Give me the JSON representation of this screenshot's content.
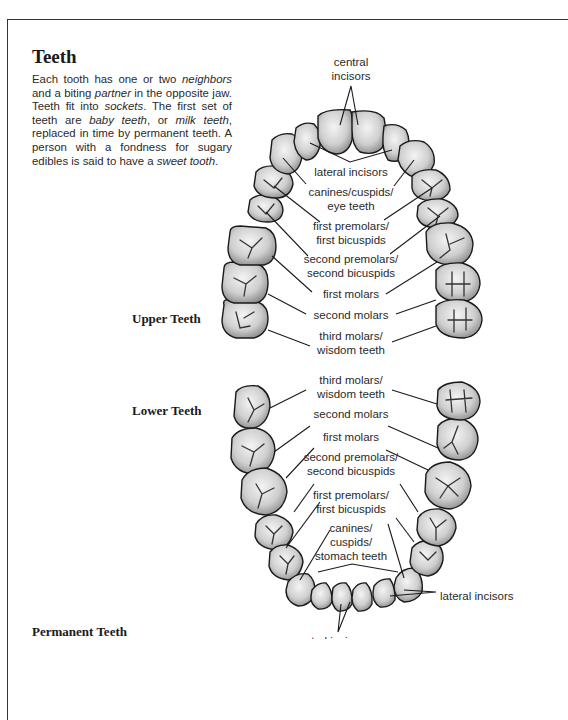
{
  "title": "Teeth",
  "intro": {
    "segments": [
      {
        "text": "Each tooth has one or two ",
        "italic": false
      },
      {
        "text": "neighbors",
        "italic": true
      },
      {
        "text": " and a biting ",
        "italic": false
      },
      {
        "text": "partner",
        "italic": true
      },
      {
        "text": " in the opposite jaw. Teeth fit into ",
        "italic": false
      },
      {
        "text": "sockets",
        "italic": true
      },
      {
        "text": ". The first set of teeth are ",
        "italic": false
      },
      {
        "text": "baby teeth",
        "italic": true
      },
      {
        "text": ", or ",
        "italic": false
      },
      {
        "text": "milk teeth",
        "italic": true
      },
      {
        "text": ", replaced in time by permanent teeth. A person with a fondness for sugary edibles is said to have a ",
        "italic": false
      },
      {
        "text": "sweet tooth",
        "italic": true
      },
      {
        "text": ".",
        "italic": false
      }
    ]
  },
  "section_labels": {
    "upper": "Upper Teeth",
    "lower": "Lower Teeth",
    "permanent": "Permanent Teeth"
  },
  "upper_labels": {
    "central_incisors_1": "central",
    "central_incisors_2": "incisors",
    "lateral_incisors": "lateral incisors",
    "canines_1": "canines/cuspids/",
    "canines_2": "eye teeth",
    "first_premolars_1": "first premolars/",
    "first_premolars_2": "first bicuspids",
    "second_premolars_1": "second premolars/",
    "second_premolars_2": "second bicuspids",
    "first_molars": "first molars",
    "second_molars": "second molars",
    "third_molars_1": "third molars/",
    "third_molars_2": "wisdom teeth"
  },
  "lower_labels": {
    "third_molars_1": "third molars/",
    "third_molars_2": "wisdom teeth",
    "second_molars": "second molars",
    "first_molars": "first molars",
    "second_premolars_1": "second premolars/",
    "second_premolars_2": "second bicuspids",
    "first_premolars_1": "first premolars/",
    "first_premolars_2": "first bicuspids",
    "canines_1": "canines/",
    "canines_2": "cuspids/",
    "canines_3": "stomach teeth",
    "lateral_incisors": "lateral incisors",
    "central_incisors": "central incisors"
  }
}
